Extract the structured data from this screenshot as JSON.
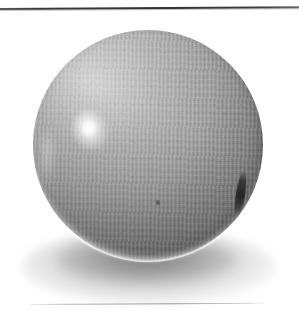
{
  "page": {
    "background_color": "#ffffff",
    "width": 299,
    "height": 311
  },
  "rules": {
    "top": {
      "name": "top-horizontal-rule",
      "color": "#3a3a3a",
      "thickness_px": 2
    },
    "bottom": {
      "name": "bottom-horizontal-rule",
      "color": "#a8a8a8",
      "thickness_px": 1
    }
  },
  "photo": {
    "subject": "gray fabric-covered ball",
    "caption": "",
    "background_color": "#ffffff",
    "ball": {
      "shape": "sphere",
      "base_color": "#a0a0a0",
      "light_color": "#c9c9c9",
      "shadow_color": "#7b7b7b",
      "surface": "woven fabric weave",
      "center_x": 148,
      "center_y": 145,
      "diameter_px": 230
    },
    "highlight": {
      "name": "specular-highlight",
      "color": "#ffffff",
      "position": "upper-left"
    },
    "seam": {
      "name": "dark-seam-mark",
      "color": "#2c2c2c",
      "position": "right-rim"
    },
    "fleck": {
      "name": "surface-blemish",
      "color": "#464646"
    },
    "rim_light": {
      "name": "bottom-rim-light",
      "color": "#ffffff",
      "position": "bottom-edge"
    },
    "cast_shadow": {
      "name": "cast-shadow",
      "color": "#606060",
      "position": "below-ball"
    }
  }
}
